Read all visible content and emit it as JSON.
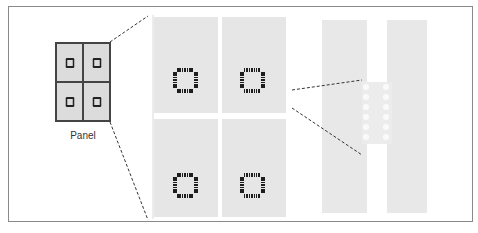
{
  "diagram": {
    "small_panel": {
      "label": "Panel",
      "cells": [
        {
          "id": "top-left",
          "component": "chip"
        },
        {
          "id": "top-right",
          "component": "chip"
        },
        {
          "id": "bottom-left",
          "component": "chip"
        },
        {
          "id": "bottom-right",
          "component": "chip"
        }
      ]
    },
    "enlarged_panel": {
      "description": "Zoomed view of panel with four boards each containing a QFP chip",
      "boards": [
        {
          "id": "board-1",
          "chip": "qfp"
        },
        {
          "id": "board-2",
          "chip": "qfp"
        },
        {
          "id": "board-3",
          "chip": "qfp"
        },
        {
          "id": "board-4",
          "chip": "qfp"
        }
      ]
    },
    "detail_view": {
      "description": "Zoomed view of connection between two strips with two columns of six holes",
      "strips": 2,
      "hole_rows": 6,
      "hole_columns": 2
    },
    "colors": {
      "board_fill": "#e6e6e6",
      "pin_color": "#1e1e1e",
      "frame_border": "#8a8a8a",
      "dashed_line": "#333333"
    }
  }
}
